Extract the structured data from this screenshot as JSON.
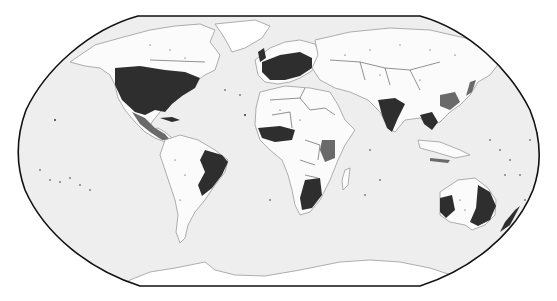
{
  "map": {
    "projection": "Robinson",
    "style": "grayscale dot-density",
    "colors": {
      "background": "#ffffff",
      "ocean": "#eeeeee",
      "land": "#fbfbfb",
      "coastline": "#9a9a9a",
      "dense_points": "#2e2e2e",
      "frame": "#111111"
    },
    "dense_regions": [
      "Eastern United States",
      "Central America",
      "Eastern Brazil",
      "Western Europe",
      "India",
      "Southeast Asia",
      "West Africa",
      "Southern Africa",
      "Eastern & Southwestern Australia"
    ],
    "labels": []
  }
}
